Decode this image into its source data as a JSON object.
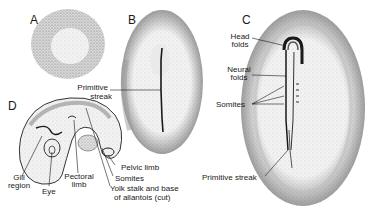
{
  "panels": {
    "A": {
      "letter": "A"
    },
    "B": {
      "letter": "B",
      "labels": {
        "primitive_streak": [
          "Primitive",
          "streak"
        ]
      }
    },
    "C": {
      "letter": "C",
      "labels": {
        "head_folds": [
          "Head",
          "folds"
        ],
        "neural_folds": [
          "Neural",
          "folds"
        ],
        "somites": "Somites",
        "primitive_streak": "Primitive streak"
      }
    },
    "D": {
      "letter": "D",
      "labels": {
        "gill_region": [
          "Gill",
          "region"
        ],
        "eye": "Eye",
        "pectoral_limb": [
          "Pectoral",
          "limb"
        ],
        "pelvic_limb": "Pelvic limb",
        "somites": "Somites",
        "yolk_stalk": [
          "Yolk stalk and base",
          "of allantois (cut)"
        ]
      }
    }
  },
  "colors": {
    "ink": "#1a1a1a",
    "stipple_dark": "#8a8a8a",
    "stipple_light": "#c8c8c8",
    "background": "#ffffff"
  }
}
